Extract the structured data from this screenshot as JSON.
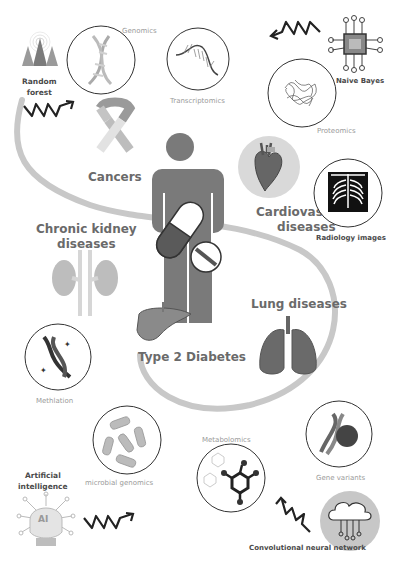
{
  "center": {
    "figure": "person-with-medication"
  },
  "diseases": [
    {
      "id": "cancers",
      "label": "Cancers"
    },
    {
      "id": "cardiovascular",
      "label": "Cardiovascular diseases",
      "line1": "Cardiovascular",
      "line2": "diseases"
    },
    {
      "id": "ckd",
      "label": "Chronic kidney diseases",
      "line1": "Chronic kidney",
      "line2": "diseases"
    },
    {
      "id": "lung",
      "label": "Lung diseases"
    },
    {
      "id": "t2d",
      "label": "Type 2 Diabetes"
    }
  ],
  "omics": [
    {
      "id": "genomics",
      "label": "Genomics"
    },
    {
      "id": "transcriptomics",
      "label": "Transcriptomics"
    },
    {
      "id": "proteomics",
      "label": "Proteomics"
    },
    {
      "id": "radiology",
      "label": "Radiology images"
    },
    {
      "id": "methylation",
      "label": "Methlation"
    },
    {
      "id": "microbial",
      "label": "microbial genomics"
    },
    {
      "id": "metabolomics",
      "label": "Metabolomics"
    },
    {
      "id": "gene_variants",
      "label": "Gene variants"
    }
  ],
  "ai_methods": [
    {
      "id": "random_forest",
      "label": "Random forest",
      "line1": "Random",
      "line2": "forest"
    },
    {
      "id": "naive_bayes",
      "label": "Naive Bayes"
    },
    {
      "id": "ai",
      "label": "Artificial intelligence",
      "line1": "Artificial",
      "line2": "intelligence",
      "badge": "AI"
    },
    {
      "id": "cnn",
      "label": "Convolutional neural network"
    }
  ],
  "colors": {
    "curve": "#c8c8c8",
    "body": "#7a7a7a",
    "outline": "#333333",
    "label": "#6a6a6a"
  }
}
